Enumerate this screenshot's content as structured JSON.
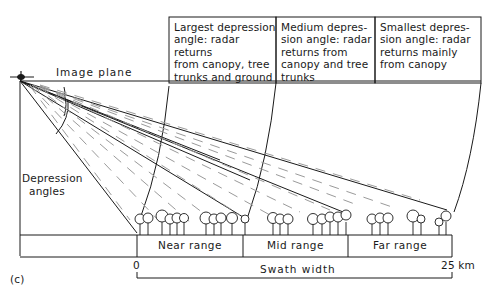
{
  "figure": {
    "panel_label": "(c)",
    "image_plane_label": "Image plane",
    "depression_label_line1": "Depression",
    "depression_label_line2": "angles",
    "callouts": [
      {
        "text": "Largest depression angle: radar returns from canopy, tree trunks and ground"
      },
      {
        "text": "Medium depres-sion angle: radar returns from canopy and tree trunks"
      },
      {
        "text": "Smallest depres-sion angle: radar returns mainly from canopy"
      }
    ],
    "callout_lines": [
      [
        "Largest depression",
        "angle: radar returns",
        "from canopy, tree",
        "trunks and ground"
      ],
      [
        "Medium depres-",
        "sion angle: radar",
        "returns from",
        "canopy and tree",
        "trunks"
      ],
      [
        "Smallest depres-",
        "sion angle: radar",
        "returns mainly",
        "from canopy"
      ]
    ],
    "ranges": [
      "Near range",
      "Mid range",
      "Far range"
    ],
    "swath": {
      "label": "Swath width",
      "start": "0",
      "end": "25 km"
    },
    "colors": {
      "ink": "#1a1a1a",
      "dash": "#9a9a9a",
      "background": "#ffffff"
    }
  }
}
